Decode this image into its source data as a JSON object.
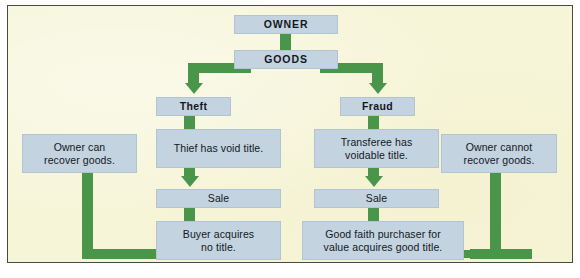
{
  "diagram": {
    "title_node": "OWNER",
    "second_node": "GOODS",
    "branches": {
      "left": {
        "label": "Theft",
        "status": "Thief has void title.",
        "event": "Sale",
        "result": "Buyer acquires\nno title.",
        "outcome": "Owner can\nrecover goods."
      },
      "right": {
        "label": "Fraud",
        "status": "Transferee has\nvoidable title.",
        "event": "Sale",
        "result": "Good faith purchaser for\nvalue acquires good title.",
        "outcome": "Owner cannot\nrecover goods."
      }
    },
    "nodes": {
      "owner": "OWNER",
      "goods": "GOODS",
      "theft": "Theft",
      "fraud": "Fraud",
      "thief_void": "Thief has void title.",
      "transferee_voidable_l1": "Transferee has",
      "transferee_voidable_l2": "voidable title.",
      "sale_left": "Sale",
      "sale_right": "Sale",
      "buyer_l1": "Buyer acquires",
      "buyer_l2": "no title.",
      "gfp_l1": "Good faith purchaser for",
      "gfp_l2": "value acquires good title.",
      "owner_can_l1": "Owner can",
      "owner_can_l2": "recover goods.",
      "owner_cannot_l1": "Owner cannot",
      "owner_cannot_l2": "recover goods."
    },
    "colors": {
      "background": "#f6f5d8",
      "box_fill": "#c3d3e0",
      "connector": "#49964b",
      "frame_border": "#4a4a42",
      "text": "#13181d"
    }
  }
}
